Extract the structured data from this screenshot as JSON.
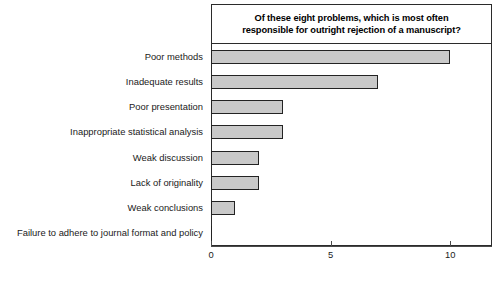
{
  "chart_data": {
    "type": "bar",
    "orientation": "horizontal",
    "title": "Of these eight problems, which is most often responsible for outright rejection of a manuscript?",
    "title_lines": [
      "Of these eight problems, which is most often",
      "responsible for outright rejection of a manuscript?"
    ],
    "categories": [
      "Poor methods",
      "Inadequate results",
      "Poor presentation",
      "Inappropriate statistical analysis",
      "Weak discussion",
      "Lack of originality",
      "Weak conclusions",
      "Failure to adhere to journal format and policy"
    ],
    "values": [
      10,
      7,
      3,
      3,
      2,
      2,
      1,
      0
    ],
    "xlabel": "",
    "ylabel": "",
    "xlim": [
      0,
      11.75
    ],
    "xticks": [
      0,
      5,
      10
    ],
    "xticklabels": [
      "0",
      "5",
      "10"
    ],
    "grid": false,
    "legend": null,
    "bar_fill_color": "#c9c9c9",
    "bar_edge_color": "#232323",
    "frame_color": "#2b2b2b",
    "text_color": "#1a1a1a"
  }
}
